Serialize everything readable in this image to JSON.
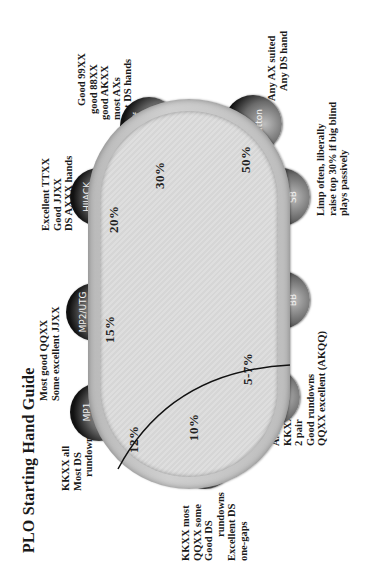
{
  "title": "PLO Starting Hand Guide",
  "seats": [
    {
      "label": "MP1",
      "pct": "12%"
    },
    {
      "label": "MP2/UTG",
      "pct": "15%"
    },
    {
      "label": "HIJACK",
      "pct": "20%"
    },
    {
      "label": "Cutoff",
      "pct": "30%"
    },
    {
      "label": "Button",
      "pct": "50%"
    },
    {
      "label": "SB",
      "pct": ""
    },
    {
      "label": "BB",
      "pct": ""
    },
    {
      "label": "UTG",
      "pct": "5-7%"
    },
    {
      "label": "UTG+1",
      "pct": "10%"
    }
  ],
  "notes": {
    "mp1": [
      "KKXX all",
      "Most DS",
      "rundowns"
    ],
    "mp2": [
      "Most good QQXX",
      "Some excellent JJXX"
    ],
    "hijack": [
      "Excellent TTXX",
      "Good JJXX",
      "DS AXXX hands"
    ],
    "cutoff": [
      "Good 99XX",
      "good 88XX",
      "good AKXX",
      "most AXs",
      "most DS hands"
    ],
    "button": [
      "Any AX suited",
      "Any DS hand"
    ],
    "blinds": [
      "Limp often, liberally",
      "raise top 30% if big blind",
      "plays passively"
    ],
    "utg": [
      "AAXX",
      "KKXX good",
      "2 pair",
      "Good rundowns",
      "QQXX excellent (AKQQ)"
    ],
    "utg1": [
      "KKXX most",
      "QQXX some",
      "Good DS",
      "rundowns",
      "Excellent DS",
      "one-gaps"
    ]
  },
  "colors": {
    "felt": "#dadada",
    "rail": "#c4c4c4",
    "seat": "#1a1a1a",
    "line": "#111111"
  }
}
